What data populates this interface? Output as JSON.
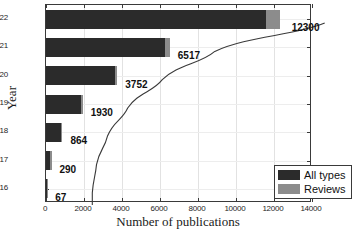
{
  "chart_data": {
    "type": "bar",
    "orientation": "horizontal",
    "stacked": true,
    "title": "",
    "xlabel": "Number of publications",
    "ylabel": "Year",
    "categories": [
      "2022",
      "2021",
      "2020",
      "2019",
      "2018",
      "2017",
      "2016"
    ],
    "xlim": [
      0,
      14000
    ],
    "xticks": [
      0,
      2000,
      4000,
      6000,
      8000,
      10000,
      12000,
      14000
    ],
    "xtick_labels": [
      "0",
      "2000",
      "4000",
      "6000",
      "8000",
      "10000",
      "12000",
      "14000"
    ],
    "grid": true,
    "legend_position": "lower right",
    "series": [
      {
        "name": "All types",
        "color": "#2b2b2b",
        "values": [
          11600,
          6250,
          3620,
          1870,
          820,
          270,
          60
        ]
      },
      {
        "name": "Reviews",
        "color": "#8c8c8c",
        "values": [
          700,
          267,
          132,
          60,
          44,
          20,
          7
        ]
      }
    ],
    "totals": [
      12300,
      6517,
      3752,
      1930,
      864,
      290,
      67
    ],
    "data_labels": [
      "12300",
      "6517",
      "3752",
      "1930",
      "864",
      "290",
      "67"
    ],
    "annotation_curve": {
      "present": true,
      "description": "smooth trend line through bar ends",
      "color": "#3a3a3a"
    }
  },
  "legend": {
    "items": [
      {
        "label": "All types",
        "color": "#2b2b2b",
        "swatch": "all"
      },
      {
        "label": "Reviews",
        "color": "#8c8c8c",
        "swatch": "rev"
      }
    ]
  }
}
